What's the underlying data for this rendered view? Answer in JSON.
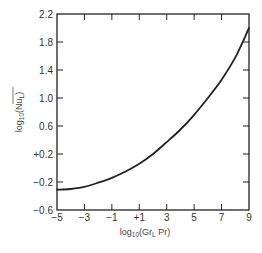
{
  "chart_data": {
    "type": "line",
    "title": "",
    "xlabel": "log10(Gr_L Pr)",
    "ylabel": "log10(Nu_L bar)",
    "xlim": [
      -5,
      9
    ],
    "ylim": [
      -0.6,
      2.2
    ],
    "grid": false,
    "legend": null,
    "x_ticks": [
      -5,
      -3,
      -1,
      1,
      3,
      5,
      7,
      9
    ],
    "x_tick_labels": [
      "−5",
      "−3",
      "−1",
      "+1",
      "3",
      "5",
      "7",
      "9"
    ],
    "y_ticks": [
      -0.6,
      -0.2,
      0.2,
      0.6,
      1.0,
      1.4,
      1.8,
      2.2
    ],
    "y_tick_labels": [
      "−0.6",
      "−0.2",
      "+0.2",
      "0.6",
      "1.0",
      "1.4",
      "1.8",
      "2.2"
    ],
    "series": [
      {
        "name": "log10(Nu_L) vs log10(Gr_L Pr)",
        "x": [
          -5,
          -4,
          -3,
          -2,
          -1,
          0,
          1,
          2,
          3,
          4,
          5,
          6,
          7,
          8,
          9
        ],
        "y": [
          -0.31,
          -0.3,
          -0.27,
          -0.21,
          -0.14,
          -0.05,
          0.06,
          0.2,
          0.37,
          0.55,
          0.76,
          1.0,
          1.26,
          1.58,
          2.0
        ]
      }
    ]
  },
  "axes": {
    "x_label_main": "log",
    "x_label_sub": "10",
    "x_label_rest": "(Gr",
    "x_label_sub2": "L",
    "x_label_end": " Pr)",
    "y_label_main": "log",
    "y_label_sub": "10",
    "y_label_rest": "(Nu",
    "y_label_sub2": "L",
    "y_label_end": ")"
  }
}
